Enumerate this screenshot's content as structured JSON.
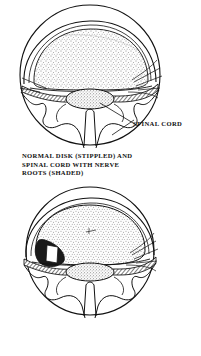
{
  "document": {
    "type": "anatomical-illustration",
    "style": "black-and-white line drawing",
    "background_color": "#ffffff",
    "ink_color": "#111111"
  },
  "figures": [
    {
      "id": "normal-disk",
      "caption": "NORMAL DISK (STIPPLED) AND\nSPINAL CORD WITH NERVE\nROOTS (SHADED)",
      "caption_lines": [
        "NORMAL DISK (STIPPLED) AND",
        "SPINAL CORD WITH NERVE",
        "ROOTS (SHADED)"
      ],
      "view": "axial cross-section of vertebra",
      "parts": [
        {
          "name": "intervertebral disk",
          "texture": "stippled",
          "shape": "broad dome"
        },
        {
          "name": "spinal cord",
          "texture": "stippled oval",
          "shape": "small oval in canal"
        },
        {
          "name": "nerve roots",
          "texture": "shaded hatching",
          "shape": "transverse band fanning laterally"
        },
        {
          "name": "vertebral arch",
          "texture": "outline",
          "shape": "lobed wavy arch"
        },
        {
          "name": "spinous process",
          "texture": "outline",
          "shape": "central vertical cleft"
        },
        {
          "name": "vertebral outline",
          "texture": "outline",
          "shape": "circle"
        }
      ],
      "callouts": [
        {
          "label": "SPINAL CORD",
          "points_to": "spinal cord"
        }
      ]
    },
    {
      "id": "slipped-disk",
      "caption": "SLIPPED DISK (STIPPLED)\nIMPINGING ON NERVE\nROOT (SHADED)",
      "caption_lines": [
        "SLIPPED DISK (STIPPLED)",
        "IMPINGING ON NERVE",
        "ROOT (SHADED)"
      ],
      "view": "axial cross-section of vertebra",
      "parts": [
        {
          "name": "herniated disk",
          "texture": "stippled",
          "shape": "rounded bulging mass"
        },
        {
          "name": "herniation protrusion",
          "texture": "dark solid with white wedge",
          "shape": "left lateral protrusion"
        },
        {
          "name": "spinal cord",
          "texture": "stippled oval",
          "shape": "small oval in canal"
        },
        {
          "name": "nerve root",
          "texture": "shaded hatching",
          "shape": "compressed transverse band"
        },
        {
          "name": "vertebral arch",
          "texture": "outline",
          "shape": "lobed wavy arch"
        },
        {
          "name": "spinous process",
          "texture": "outline",
          "shape": "central vertical cleft"
        },
        {
          "name": "vertebral outline",
          "texture": "outline",
          "shape": "circle"
        }
      ],
      "callouts": []
    }
  ]
}
